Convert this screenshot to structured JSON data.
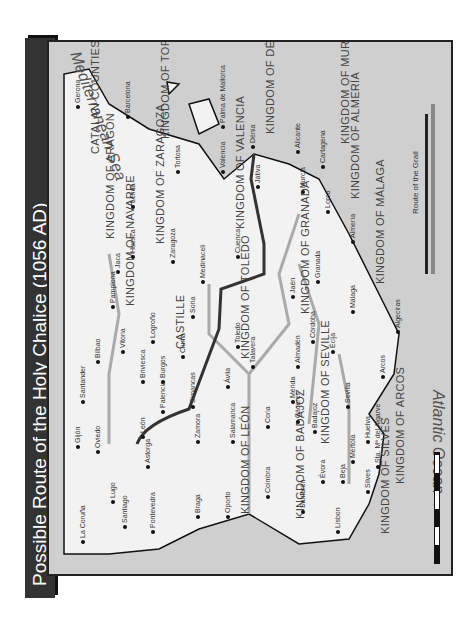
{
  "title": "Possible Route of the Holy Chalice (1056 AD)",
  "seas": {
    "atlantic": "Atlantic Ocean",
    "mediterranean": "Mediterranean Sea"
  },
  "legend": {
    "route_label": "Route of the Grail"
  },
  "kingdoms": [
    {
      "label": "KINGDOM OF LEÓN",
      "x": 60,
      "y": 190
    },
    {
      "label": "CASTILLE",
      "x": 225,
      "y": 125
    },
    {
      "label": "KINGDOM OF NAVARRE",
      "x": 268,
      "y": 75
    },
    {
      "label": "KINGDOM OF ARAGÓN",
      "x": 335,
      "y": 55
    },
    {
      "label": "CATALAN COUNTIES",
      "x": 420,
      "y": 40
    },
    {
      "label": "KINGDOM OF ZARAGOZA",
      "x": 330,
      "y": 105
    },
    {
      "label": "KINGDOM OF TORTOSA",
      "x": 435,
      "y": 110
    },
    {
      "label": "KINGDOM OF VALENCIA",
      "x": 345,
      "y": 185
    },
    {
      "label": "KINGDOM OF DÉNIA",
      "x": 440,
      "y": 215
    },
    {
      "label": "KINGDOM OF MURCIA",
      "x": 430,
      "y": 290
    },
    {
      "label": "KINGDOM OF ALMERÍA",
      "x": 375,
      "y": 300
    },
    {
      "label": "KINGDOM OF MÁLAGA",
      "x": 290,
      "y": 325
    },
    {
      "label": "KINGDOM OF GRANADA",
      "x": 260,
      "y": 250
    },
    {
      "label": "KINGDOM OF TOLEDO",
      "x": 215,
      "y": 190
    },
    {
      "label": "KINGDOM OF BADAJOZ",
      "x": 55,
      "y": 245
    },
    {
      "label": "KINGDOM OF SEVILLE",
      "x": 130,
      "y": 270
    },
    {
      "label": "KINGDOM OF SILVES",
      "x": 40,
      "y": 330
    },
    {
      "label": "KINGDOM OF ARCOS",
      "x": 90,
      "y": 345
    }
  ],
  "cities": [
    {
      "label": "La Coruña",
      "x": 30,
      "y": 30
    },
    {
      "label": "Gijón",
      "x": 125,
      "y": 25
    },
    {
      "label": "Santander",
      "x": 170,
      "y": 30
    },
    {
      "label": "Bilbao",
      "x": 210,
      "y": 45
    },
    {
      "label": "Oviedo",
      "x": 120,
      "y": 45
    },
    {
      "label": "Lugo",
      "x": 70,
      "y": 60
    },
    {
      "label": "Santiago",
      "x": 45,
      "y": 72
    },
    {
      "label": "Pontevedra",
      "x": 40,
      "y": 100
    },
    {
      "label": "Astorga",
      "x": 105,
      "y": 95
    },
    {
      "label": "León",
      "x": 135,
      "y": 90
    },
    {
      "label": "Palencia",
      "x": 160,
      "y": 110
    },
    {
      "label": "Briviesca",
      "x": 190,
      "y": 90
    },
    {
      "label": "Burgos",
      "x": 190,
      "y": 110
    },
    {
      "label": "Vitoria",
      "x": 220,
      "y": 70
    },
    {
      "label": "Pamplona",
      "x": 265,
      "y": 60
    },
    {
      "label": "Logroño",
      "x": 230,
      "y": 100
    },
    {
      "label": "Jaca",
      "x": 300,
      "y": 65
    },
    {
      "label": "Huesca",
      "x": 315,
      "y": 80
    },
    {
      "label": "Lérida",
      "x": 365,
      "y": 80
    },
    {
      "label": "Gerona",
      "x": 465,
      "y": 25
    },
    {
      "label": "Barcelona",
      "x": 455,
      "y": 75
    },
    {
      "label": "Zaragoza",
      "x": 310,
      "y": 120
    },
    {
      "label": "Tortosa",
      "x": 400,
      "y": 125
    },
    {
      "label": "Soria",
      "x": 255,
      "y": 140
    },
    {
      "label": "Clunia",
      "x": 215,
      "y": 130
    },
    {
      "label": "Simancas",
      "x": 165,
      "y": 140
    },
    {
      "label": "Zamora",
      "x": 130,
      "y": 145
    },
    {
      "label": "Medinaceli",
      "x": 290,
      "y": 150
    },
    {
      "label": "Ávila",
      "x": 185,
      "y": 175
    },
    {
      "label": "Salamanca",
      "x": 130,
      "y": 180
    },
    {
      "label": "Braga",
      "x": 55,
      "y": 145
    },
    {
      "label": "Oporto",
      "x": 55,
      "y": 175
    },
    {
      "label": "Cuenca",
      "x": 315,
      "y": 185
    },
    {
      "label": "Valencia",
      "x": 400,
      "y": 170
    },
    {
      "label": "Játiva",
      "x": 385,
      "y": 205
    },
    {
      "label": "Palma de Mallorca",
      "x": 445,
      "y": 170
    },
    {
      "label": "Dénia",
      "x": 425,
      "y": 200
    },
    {
      "label": "Alicante",
      "x": 420,
      "y": 245
    },
    {
      "label": "Cartagena",
      "x": 405,
      "y": 270
    },
    {
      "label": "Murcia",
      "x": 380,
      "y": 250
    },
    {
      "label": "Lorca",
      "x": 360,
      "y": 275
    },
    {
      "label": "Almería",
      "x": 330,
      "y": 300
    },
    {
      "label": "Talavera",
      "x": 205,
      "y": 200
    },
    {
      "label": "Toledo",
      "x": 225,
      "y": 185
    },
    {
      "label": "Almadén",
      "x": 205,
      "y": 245
    },
    {
      "label": "Jaén",
      "x": 275,
      "y": 240
    },
    {
      "label": "Granada",
      "x": 290,
      "y": 265
    },
    {
      "label": "Córdoba",
      "x": 230,
      "y": 260
    },
    {
      "label": "Écija",
      "x": 220,
      "y": 280
    },
    {
      "label": "Málaga",
      "x": 260,
      "y": 300
    },
    {
      "label": "Coria",
      "x": 145,
      "y": 215
    },
    {
      "label": "Cáceres",
      "x": 150,
      "y": 245
    },
    {
      "label": "Mérida",
      "x": 170,
      "y": 240
    },
    {
      "label": "Badajoz",
      "x": 140,
      "y": 262
    },
    {
      "label": "Coimbra",
      "x": 75,
      "y": 215
    },
    {
      "label": "Santarén",
      "x": 60,
      "y": 250
    },
    {
      "label": "Évora",
      "x": 90,
      "y": 270
    },
    {
      "label": "Lisbon",
      "x": 40,
      "y": 285
    },
    {
      "label": "Beja",
      "x": 90,
      "y": 290
    },
    {
      "label": "Mertola",
      "x": 110,
      "y": 300
    },
    {
      "label": "Silves",
      "x": 80,
      "y": 315
    },
    {
      "label": "Sta. Mª del Algarve",
      "x": 105,
      "y": 325
    },
    {
      "label": "Huelva",
      "x": 130,
      "y": 315
    },
    {
      "label": "Sevilla",
      "x": 165,
      "y": 295
    },
    {
      "label": "Arcos",
      "x": 195,
      "y": 330
    },
    {
      "label": "Algeciras",
      "x": 240,
      "y": 345
    }
  ]
}
